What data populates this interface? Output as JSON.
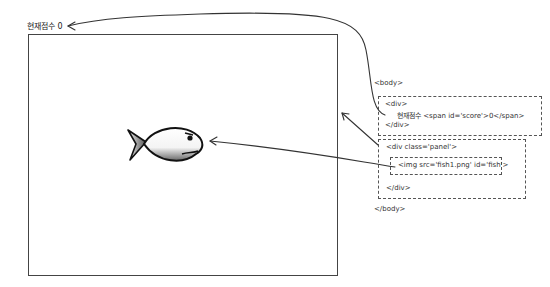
{
  "page": {
    "score_label": "현재점수",
    "score_value": "0",
    "fish_alt": "fish"
  },
  "dom_diagram": {
    "body_open": "<body>",
    "div_open": "<div>",
    "score_line": "현재점수 <span id='score'>0</span>",
    "div_close": "</div>",
    "panel_open": "<div class='panel'>",
    "img_tag": "<img src='fish1.png' id='fish'>",
    "panel_close": "</div>",
    "body_close": "</body>"
  },
  "colors": {
    "line": "#333333",
    "stage_border": "#444444",
    "dashed": "#555555",
    "background": "#ffffff"
  }
}
